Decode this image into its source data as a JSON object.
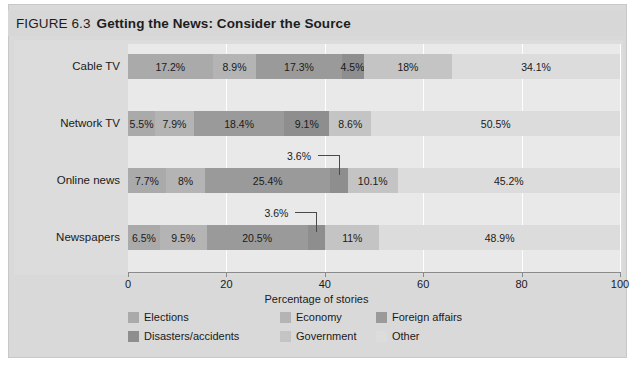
{
  "figure": {
    "label": "FIGURE 6.3",
    "title": "Getting the News: Consider the Source"
  },
  "chart_data": {
    "type": "bar",
    "orientation": "horizontal",
    "stacked": true,
    "title": "Getting the News: Consider the Source",
    "xlabel": "Percentage of stories",
    "ylabel": "",
    "xlim": [
      0,
      100
    ],
    "xticks": [
      0,
      20,
      40,
      60,
      80,
      100
    ],
    "xtick_labels": [
      "0",
      "20",
      "40",
      "60",
      "80",
      "100"
    ],
    "grid": true,
    "legend_position": "bottom-left",
    "categories": [
      "Cable TV",
      "Network TV",
      "Online news",
      "Newspapers"
    ],
    "series": [
      {
        "name": "Elections",
        "color": "#aaaaaa",
        "values": [
          17.2,
          5.5,
          7.7,
          6.5
        ]
      },
      {
        "name": "Economy",
        "color": "#b4b4b4",
        "values": [
          8.9,
          7.9,
          8.0,
          9.5
        ]
      },
      {
        "name": "Foreign affairs",
        "color": "#9a9a9a",
        "values": [
          17.3,
          18.4,
          25.4,
          20.5
        ]
      },
      {
        "name": "Disasters/accidents",
        "color": "#8e8e8e",
        "values": [
          4.5,
          9.1,
          3.6,
          3.6
        ]
      },
      {
        "name": "Government",
        "color": "#c4c4c4",
        "values": [
          18.0,
          8.6,
          10.1,
          11.0
        ]
      },
      {
        "name": "Other",
        "color": "#dcdcdc",
        "values": [
          34.1,
          50.5,
          45.2,
          48.9
        ]
      }
    ],
    "value_labels": {
      "Cable TV": [
        "17.2%",
        "8.9%",
        "17.3%",
        "4.5%",
        "18%",
        "34.1%"
      ],
      "Network TV": [
        "5.5%",
        "7.9%",
        "18.4%",
        "9.1%",
        "8.6%",
        "50.5%"
      ],
      "Online news": [
        "7.7%",
        "8%",
        "25.4%",
        "3.6%",
        "10.1%",
        "45.2%"
      ],
      "Newspapers": [
        "6.5%",
        "9.5%",
        "20.5%",
        "3.6%",
        "11%",
        "48.9%"
      ]
    },
    "callouts": [
      {
        "category": "Online news",
        "series": "Disasters/accidents",
        "label": "3.6%"
      },
      {
        "category": "Newspapers",
        "series": "Disasters/accidents",
        "label": "3.6%"
      }
    ]
  },
  "legend": {
    "items": [
      {
        "label": "Elections",
        "color": "#aaaaaa"
      },
      {
        "label": "Economy",
        "color": "#b4b4b4"
      },
      {
        "label": "Foreign affairs",
        "color": "#9a9a9a"
      },
      {
        "label": "Disasters/accidents",
        "color": "#8e8e8e"
      },
      {
        "label": "Government",
        "color": "#c4c4c4"
      },
      {
        "label": "Other",
        "color": "#dcdcdc"
      }
    ]
  }
}
